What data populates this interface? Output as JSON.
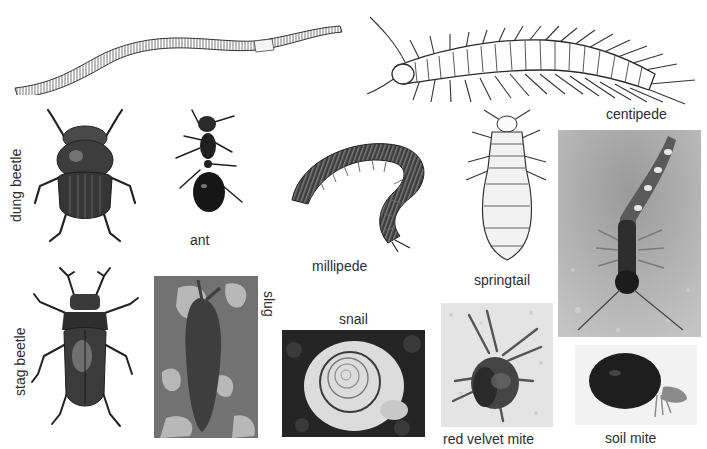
{
  "figure": {
    "background": "#ffffff",
    "organisms": [
      {
        "id": "earthworm",
        "label": "",
        "style": "drawing"
      },
      {
        "id": "centipede-drawing",
        "label": "centipede",
        "style": "drawing"
      },
      {
        "id": "dung-beetle",
        "label": "dung beetle",
        "style": "drawing",
        "label_orientation": "vertical-up"
      },
      {
        "id": "ant",
        "label": "ant",
        "style": "photo-cutout"
      },
      {
        "id": "millipede",
        "label": "millipede",
        "style": "photo-cutout"
      },
      {
        "id": "springtail",
        "label": "springtail",
        "style": "drawing"
      },
      {
        "id": "centipede-photo",
        "label": "",
        "style": "photo"
      },
      {
        "id": "stag-beetle",
        "label": "stag beetle",
        "style": "drawing",
        "label_orientation": "vertical-up"
      },
      {
        "id": "slug",
        "label": "slug",
        "style": "photo",
        "label_orientation": "vertical-down"
      },
      {
        "id": "snail",
        "label": "snail",
        "style": "photo"
      },
      {
        "id": "red-velvet-mite",
        "label": "red velvet mite",
        "style": "photo"
      },
      {
        "id": "soil-mite",
        "label": "soil mite",
        "style": "photo-cutout"
      }
    ],
    "labels": {
      "centipede": "centipede",
      "dung_beetle": "dung beetle",
      "ant": "ant",
      "millipede": "millipede",
      "springtail": "springtail",
      "stag_beetle": "stag beetle",
      "slug": "slug",
      "snail": "snail",
      "red_velvet_mite": "red velvet mite",
      "soil_mite": "soil mite"
    },
    "colors": {
      "ink": "#2b2b2b",
      "photo_dark": "#3a3a3a",
      "photo_mid": "#8a8a8a",
      "photo_light": "#cfcfcf"
    }
  }
}
